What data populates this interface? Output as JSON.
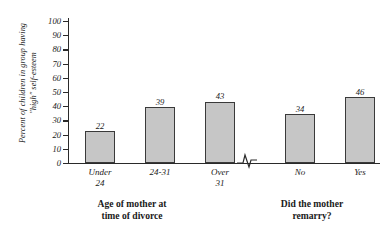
{
  "chart_data": {
    "type": "bar",
    "title": "",
    "xlabel": "",
    "ylabel": "Percent of children in group having\n\"high\" self-esteem",
    "ylim": [
      0,
      100
    ],
    "y_ticks": [
      0,
      10,
      20,
      30,
      40,
      50,
      60,
      70,
      80,
      90,
      100
    ],
    "grid": false,
    "legend": "none",
    "axis_break": true,
    "categories": [
      "Under\n24",
      "24-31",
      "Over\n31",
      "No",
      "Yes"
    ],
    "values": [
      22,
      39,
      43,
      34,
      46
    ],
    "value_labels": [
      "22",
      "39",
      "43",
      "34",
      "46"
    ],
    "groups": [
      {
        "caption": "Age of mother at\ntime of divorce",
        "categories": [
          "Under\n24",
          "24-31",
          "Over\n31"
        ],
        "values": [
          22,
          39,
          43
        ]
      },
      {
        "caption": "Did the mother\nremarry?",
        "categories": [
          "No",
          "Yes"
        ],
        "values": [
          34,
          46
        ]
      }
    ],
    "bar_color": "#c6c6c6",
    "bar_border_color": "#3a3a3a",
    "axis_color": "#2a2a2a"
  }
}
